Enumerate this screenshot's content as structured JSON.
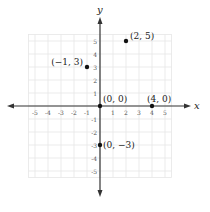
{
  "chart_data": {
    "type": "scatter",
    "title": "",
    "xlabel": "x",
    "ylabel": "y",
    "xlim": [
      -5.5,
      5.5
    ],
    "ylim": [
      -5.5,
      5.5
    ],
    "grid": true,
    "x_ticks": [
      "-5",
      "-4",
      "-3",
      "-2",
      "-1",
      "1",
      "2",
      "3",
      "4",
      "5"
    ],
    "y_ticks": [
      "5",
      "4",
      "3",
      "2",
      "1",
      "-1",
      "-2",
      "-3",
      "-4",
      "-5"
    ],
    "points": [
      {
        "x": 2,
        "y": 5,
        "label": "(2, 5)"
      },
      {
        "x": -1,
        "y": 3,
        "label": "(−1, 3)"
      },
      {
        "x": 0,
        "y": 0,
        "label": "(0, 0)"
      },
      {
        "x": 4,
        "y": 0,
        "label": "(4, 0)"
      },
      {
        "x": 0,
        "y": -3,
        "label": "(0, −3)"
      }
    ]
  },
  "colors": {
    "grid": "#e6e6e6",
    "axis": "#333333",
    "point": "#111111"
  }
}
